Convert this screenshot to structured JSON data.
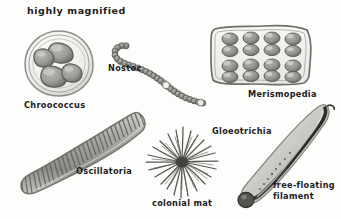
{
  "figure": {
    "heading": "highly magnified",
    "background_color": "#fdfdfc",
    "ink_color": "#1c1c1c",
    "width": 341,
    "height": 219
  },
  "labels": {
    "heading": "highly magnified",
    "chroococcus": "Chroococcus",
    "nostoc": "Nostoc",
    "merismopedia": "Merismopedia",
    "oscillatoria": "Oscillatoria",
    "gloeotrichia": "Gloeotrichia",
    "colonial_mat": "colonial mat",
    "free_floating_filament_line1": "free-floating",
    "free_floating_filament_line2": "filament"
  },
  "organisms": [
    {
      "name": "chroococcus",
      "label": "Chroococcus",
      "form": "rounded colony of four cells in a gelatinous sheath",
      "cell_count": 4
    },
    {
      "name": "nostoc",
      "label": "Nostoc",
      "form": "beaded chain of spherical cells curving down to the right",
      "bead_count": 34
    },
    {
      "name": "merismopedia",
      "label": "Merismopedia",
      "form": "flat rectangular plate of oval cells in regular rows",
      "rows": 4,
      "columns": 4
    },
    {
      "name": "oscillatoria",
      "label": "Oscillatoria",
      "form": "broad curved filament with transverse cell bands",
      "band_count": 34
    },
    {
      "name": "colonial-mat",
      "label": "colonial mat",
      "form": "radial starburst of dark filaments from a common centre",
      "ray_count": 46
    },
    {
      "name": "gloeotrichia",
      "label": "Gloeotrichia",
      "form": "long tapering S-curved filament with a bulbous basal heterocyst"
    },
    {
      "name": "free-floating-filament",
      "label": "free-floating filament",
      "form": "elongated sheathed filament with rounded base"
    }
  ]
}
